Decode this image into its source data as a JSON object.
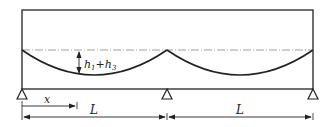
{
  "diagram": {
    "height_label_main": "h",
    "height_sub1": "1",
    "height_plus": "+h",
    "height_sub2": "3",
    "x_label": "x",
    "span_label_left": "L",
    "span_label_right": "L",
    "colors": {
      "line": "#222222",
      "dash": "#888888"
    }
  }
}
